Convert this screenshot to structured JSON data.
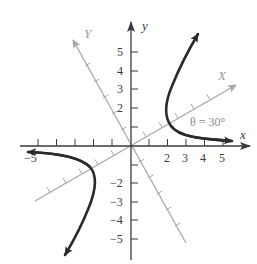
{
  "figure": {
    "colors": {
      "axis": "#3a3a3a",
      "rotated_axis": "#a8a8a8",
      "curve": "#2a2a2a",
      "background": "#ffffff"
    },
    "axes": {
      "x_label": "x",
      "y_label": "y",
      "rotated_x_label": "X",
      "rotated_y_label": "Y",
      "x_ticks": [
        -5,
        -4,
        -3,
        -2,
        -1,
        1,
        2,
        3,
        4,
        5
      ],
      "y_ticks": [
        -5,
        -4,
        -3,
        -2,
        -1,
        1,
        2,
        3,
        4,
        5
      ],
      "x_tick_labels": {
        "neg5": "−5",
        "pos2": "2",
        "pos3": "3",
        "pos4": "4",
        "pos5": "5"
      },
      "y_tick_labels": {
        "pos5": "5",
        "pos4": "4",
        "pos3": "3",
        "pos2": "2",
        "neg2": "−2",
        "neg3": "−3",
        "neg4": "−4",
        "neg5": "−5"
      }
    },
    "annotation": {
      "angle_label": "θ = 30°",
      "angle_degrees": 30
    },
    "curves": [
      {
        "name": "upper-right-branch",
        "description": "hyperbola branch in quadrant I, vertex near (2, 1.7)"
      },
      {
        "name": "lower-left-branch",
        "description": "hyperbola branch in quadrant III, vertex near (-2, -1.7)"
      }
    ]
  }
}
